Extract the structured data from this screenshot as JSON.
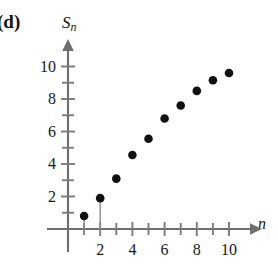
{
  "panel": {
    "label": "(d)"
  },
  "axes": {
    "ylabel": "S",
    "ylabel_subscript": "n",
    "xlabel": "n",
    "y_tick_labels": [
      "2",
      "4",
      "6",
      "8",
      "10"
    ],
    "x_tick_labels": [
      "2",
      "4",
      "6",
      "8",
      "10"
    ]
  },
  "chart_data": {
    "type": "scatter",
    "title": "",
    "subtitle": "",
    "xlabel": "n",
    "ylabel": "S_n",
    "x": [
      1,
      2,
      3,
      4,
      5,
      6,
      7,
      8,
      9,
      10
    ],
    "values": [
      0.8,
      1.9,
      3.1,
      4.55,
      5.55,
      6.8,
      7.6,
      8.5,
      9.15,
      9.6
    ],
    "series": [
      {
        "name": "S_n",
        "x": [
          1,
          2,
          3,
          4,
          5,
          6,
          7,
          8,
          9,
          10
        ],
        "values": [
          0.8,
          1.9,
          3.1,
          4.55,
          5.55,
          6.8,
          7.6,
          8.5,
          9.15,
          9.6
        ]
      }
    ],
    "xlim": [
      0,
      11
    ],
    "ylim": [
      0,
      10.6
    ],
    "x_major_ticks": [
      2,
      4,
      6,
      8,
      10
    ],
    "x_minor_ticks": [
      1,
      3,
      5,
      7,
      9
    ],
    "y_major_ticks": [
      2,
      4,
      6,
      8,
      10
    ],
    "y_minor_ticks": [
      1,
      3,
      5,
      7,
      9
    ],
    "grid": false,
    "legend": "none",
    "marker": "filled-circle",
    "marker_color": "#101010",
    "axis_color": "#6e6e6e",
    "background": "#ffffff",
    "annotations": []
  }
}
